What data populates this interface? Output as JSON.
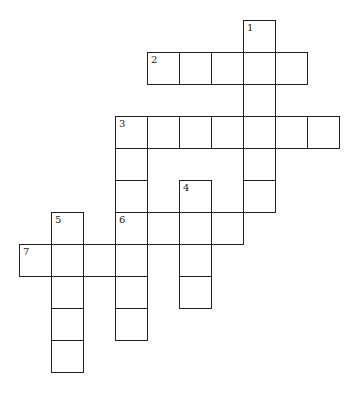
{
  "puzzle": {
    "type": "crossword",
    "cell_size": 32,
    "origin_x": 19,
    "origin_y": 20,
    "line_color": "#222222",
    "cells": [
      {
        "c": 7,
        "r": 0,
        "n": "1"
      },
      {
        "c": 7,
        "r": 1,
        "n": ""
      },
      {
        "c": 7,
        "r": 2,
        "n": ""
      },
      {
        "c": 7,
        "r": 3,
        "n": ""
      },
      {
        "c": 7,
        "r": 4,
        "n": ""
      },
      {
        "c": 7,
        "r": 5,
        "n": ""
      },
      {
        "c": 4,
        "r": 1,
        "n": "2"
      },
      {
        "c": 5,
        "r": 1,
        "n": ""
      },
      {
        "c": 6,
        "r": 1,
        "n": ""
      },
      {
        "c": 8,
        "r": 1,
        "n": ""
      },
      {
        "c": 3,
        "r": 3,
        "n": "3"
      },
      {
        "c": 4,
        "r": 3,
        "n": ""
      },
      {
        "c": 5,
        "r": 3,
        "n": ""
      },
      {
        "c": 6,
        "r": 3,
        "n": ""
      },
      {
        "c": 8,
        "r": 3,
        "n": ""
      },
      {
        "c": 9,
        "r": 3,
        "n": ""
      },
      {
        "c": 3,
        "r": 4,
        "n": ""
      },
      {
        "c": 3,
        "r": 5,
        "n": ""
      },
      {
        "c": 3,
        "r": 6,
        "n": "6"
      },
      {
        "c": 3,
        "r": 7,
        "n": ""
      },
      {
        "c": 3,
        "r": 8,
        "n": ""
      },
      {
        "c": 3,
        "r": 9,
        "n": ""
      },
      {
        "c": 5,
        "r": 5,
        "n": "4"
      },
      {
        "c": 5,
        "r": 6,
        "n": ""
      },
      {
        "c": 5,
        "r": 7,
        "n": ""
      },
      {
        "c": 5,
        "r": 8,
        "n": ""
      },
      {
        "c": 4,
        "r": 6,
        "n": ""
      },
      {
        "c": 6,
        "r": 6,
        "n": ""
      },
      {
        "c": 1,
        "r": 6,
        "n": "5"
      },
      {
        "c": 1,
        "r": 7,
        "n": ""
      },
      {
        "c": 1,
        "r": 8,
        "n": ""
      },
      {
        "c": 1,
        "r": 9,
        "n": ""
      },
      {
        "c": 1,
        "r": 10,
        "n": ""
      },
      {
        "c": 0,
        "r": 7,
        "n": "7"
      },
      {
        "c": 2,
        "r": 7,
        "n": ""
      }
    ],
    "clue_numbers": [
      "1",
      "2",
      "3",
      "4",
      "5",
      "6",
      "7"
    ]
  }
}
